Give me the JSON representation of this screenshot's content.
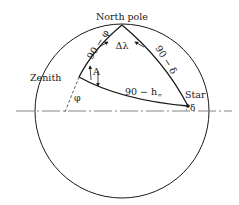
{
  "diagram": {
    "type": "celestial-navigation-triangle",
    "labels": {
      "north_pole": "North pole",
      "zenith": "Zenith",
      "star": "Star",
      "colatitude": "90 − φ",
      "polar_distance": "90 − δ",
      "zenith_distance": "90 − h",
      "zenith_distance_sub": "∞",
      "delta_lambda": "Δλ",
      "azimuth": "A",
      "latitude": "φ",
      "declination": "δ"
    },
    "colors": {
      "stroke": "#1a1a1a",
      "equator": "#777777",
      "background": "#ffffff"
    }
  }
}
